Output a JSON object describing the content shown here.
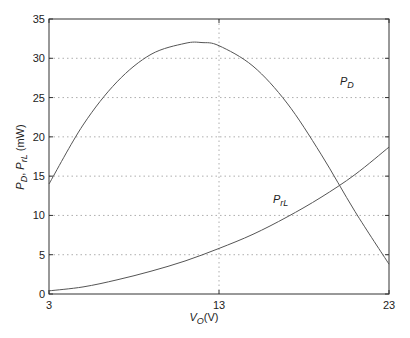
{
  "chart_data": {
    "type": "line",
    "title": "",
    "xlabel": "V_O(V)",
    "ylabel": "P_D, P_rL (mW)",
    "xlim": [
      3,
      23
    ],
    "ylim": [
      0,
      35
    ],
    "x_ticks": [
      "3",
      "13",
      "23"
    ],
    "y_ticks": [
      "0",
      "5",
      "10",
      "15",
      "20",
      "25",
      "30",
      "35"
    ],
    "grid": "dotted",
    "legend": "inline labels",
    "series": [
      {
        "name": "P_D",
        "x": [
          3,
          5,
          7,
          9,
          11,
          12,
          13,
          15,
          17,
          19,
          21,
          23
        ],
        "values": [
          14.0,
          21.5,
          27.0,
          30.5,
          31.9,
          32.0,
          31.6,
          29.0,
          24.3,
          17.8,
          10.5,
          3.8
        ]
      },
      {
        "name": "P_rL",
        "x": [
          3,
          5,
          7,
          9,
          11,
          13,
          15,
          17,
          19,
          21,
          23
        ],
        "values": [
          0.4,
          0.9,
          1.8,
          2.9,
          4.2,
          5.8,
          7.6,
          9.8,
          12.3,
          15.2,
          18.7
        ]
      }
    ],
    "annotations": [
      {
        "text": "P_D",
        "x": 19.5,
        "y": 27.5
      },
      {
        "text": "P_rL",
        "x": 16.2,
        "y": 13.5
      }
    ]
  },
  "labels": {
    "x_axis_main": "V",
    "x_axis_sub": "O",
    "x_axis_unit": "(V)",
    "y_axis_p1": "P",
    "y_axis_sub1": "D",
    "y_axis_sep": ", ",
    "y_axis_p2": "P",
    "y_axis_sub2": "rL",
    "y_axis_unit": " (mW)",
    "pd_main": "P",
    "pd_sub": "D",
    "prl_main": "P",
    "prl_sub": "rL"
  }
}
